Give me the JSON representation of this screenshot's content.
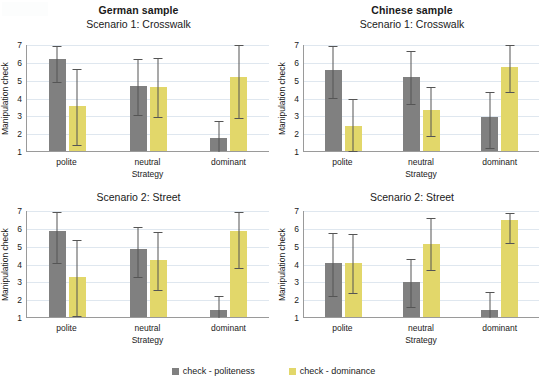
{
  "chart_data": {
    "type": "bar",
    "title": "",
    "categories": [
      "polite",
      "neutral",
      "dominant"
    ],
    "xlabel": "Strategy",
    "ylabel": "Manipulation check",
    "ylim": [
      1,
      7
    ],
    "yticks": [
      1,
      2,
      3,
      4,
      5,
      6,
      7
    ],
    "grid": true,
    "legend_position": "bottom",
    "legend": [
      "check - politeness",
      "check - dominance"
    ],
    "colors": {
      "politeness": "#808080",
      "dominance": "#e2d76a",
      "gridline": "#dfe7ef",
      "axis": "#9a9a9a",
      "errorbar": "#555555"
    },
    "panels": [
      {
        "id": "german-scenario-1",
        "sample_title": "German sample",
        "scenario_title": "Scenario 1: Crosswalk",
        "series": [
          {
            "name": "check - politeness",
            "values": [
              6.15,
              4.65,
              1.72
            ],
            "err_low": [
              4.95,
              3.05,
              1.0
            ],
            "err_high": [
              6.95,
              6.2,
              2.75
            ]
          },
          {
            "name": "check - dominance",
            "values": [
              3.5,
              4.6,
              5.15
            ],
            "err_low": [
              1.38,
              2.95,
              2.92
            ],
            "err_high": [
              5.68,
              6.25,
              7.0
            ]
          }
        ]
      },
      {
        "id": "chinese-scenario-1",
        "sample_title": "Chinese sample",
        "scenario_title": "Scenario 1: Crosswalk",
        "series": [
          {
            "name": "check - politeness",
            "values": [
              5.55,
              5.15,
              2.88
            ],
            "err_low": [
              4.05,
              3.68,
              1.22
            ],
            "err_high": [
              6.95,
              6.65,
              4.35
            ]
          },
          {
            "name": "check - dominance",
            "values": [
              2.4,
              3.28,
              5.72
            ],
            "err_low": [
              1.08,
              1.92,
              4.38
            ],
            "err_high": [
              3.95,
              4.62,
              7.0
            ]
          }
        ]
      },
      {
        "id": "german-scenario-2",
        "sample_title": "",
        "scenario_title": "Scenario 2: Street",
        "series": [
          {
            "name": "check - politeness",
            "values": [
              5.8,
              4.8,
              1.42
            ],
            "err_low": [
              4.1,
              3.32,
              1.0
            ],
            "err_high": [
              6.95,
              6.12,
              2.25
            ]
          },
          {
            "name": "check - dominance",
            "values": [
              3.25,
              4.22,
              5.8
            ],
            "err_low": [
              1.12,
              2.58,
              3.82
            ],
            "err_high": [
              5.35,
              5.8,
              6.95
            ]
          }
        ]
      },
      {
        "id": "chinese-scenario-2",
        "sample_title": "",
        "scenario_title": "Scenario 2: Street",
        "series": [
          {
            "name": "check - politeness",
            "values": [
              4.02,
              2.95,
              1.38
            ],
            "err_low": [
              2.25,
              1.62,
              1.0
            ],
            "err_high": [
              5.75,
              4.3,
              2.45
            ]
          },
          {
            "name": "check - dominance",
            "values": [
              4.02,
              5.1,
              6.42
            ],
            "err_low": [
              2.38,
              3.7,
              5.18
            ],
            "err_high": [
              5.72,
              6.58,
              6.9
            ]
          }
        ]
      }
    ]
  }
}
